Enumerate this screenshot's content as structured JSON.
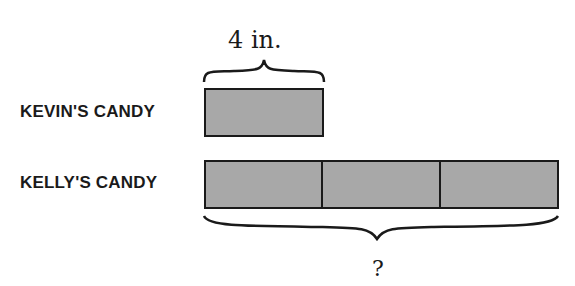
{
  "diagram": {
    "type": "tape-diagram",
    "top_measure": "4 in.",
    "bottom_measure": "?",
    "rows": [
      {
        "label": "KEVIN'S CANDY",
        "segments": 1
      },
      {
        "label": "KELLY'S CANDY",
        "segments": 3
      }
    ],
    "colors": {
      "fill": "#a8a8a8",
      "stroke": "#1a1a1a"
    }
  }
}
